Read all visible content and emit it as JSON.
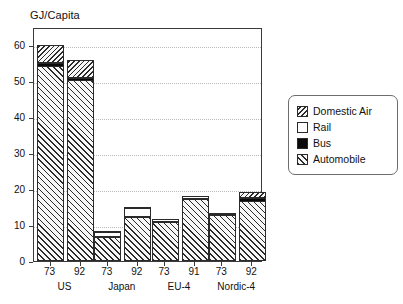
{
  "chart_data": {
    "type": "bar",
    "stacked": true,
    "title": "GJ/Capita",
    "xlabel": "",
    "ylabel": "",
    "ylim": [
      0,
      65
    ],
    "yticks": [
      0,
      10,
      20,
      30,
      40,
      50,
      60
    ],
    "ytick_labels": [
      "0",
      "10",
      "20",
      "30",
      "40",
      "50",
      "60"
    ],
    "grid": "horizontal-dotted",
    "legend_position": "right",
    "categories": [
      "73",
      "92",
      "73",
      "92",
      "73",
      "91",
      "73",
      "92"
    ],
    "groups": [
      {
        "label": "US",
        "years": [
          "73",
          "92"
        ]
      },
      {
        "label": "Japan",
        "years": [
          "73",
          "92"
        ]
      },
      {
        "label": "EU-4",
        "years": [
          "73",
          "91"
        ]
      },
      {
        "label": "Nordic-4",
        "years": [
          "73",
          "92"
        ]
      }
    ],
    "series": [
      {
        "name": "Automobile",
        "pattern": "forward-hatch",
        "values": [
          54.2,
          50.2,
          6.7,
          12.2,
          10.9,
          17.3,
          12.7,
          16.8
        ]
      },
      {
        "name": "Bus",
        "pattern": "solid-black",
        "values": [
          1.1,
          1.0,
          0.6,
          0.5,
          0.5,
          0.6,
          0.7,
          1.1
        ]
      },
      {
        "name": "Rail",
        "pattern": "white",
        "values": [
          0.3,
          0.3,
          1.3,
          2.5,
          0.7,
          0.8,
          0.6,
          0.4
        ]
      },
      {
        "name": "Domestic Air",
        "pattern": "backward-hatch",
        "values": [
          4.9,
          5.0,
          0.1,
          0.3,
          0.0,
          0.0,
          0.0,
          1.5
        ]
      }
    ],
    "totals": [
      60.5,
      56.5,
      8.7,
      15.5,
      12.1,
      18.7,
      14.0,
      19.8
    ]
  },
  "legend": {
    "items": [
      {
        "label": "Domestic Air",
        "pattern": "backward-hatch"
      },
      {
        "label": "Rail",
        "pattern": "white"
      },
      {
        "label": "Bus",
        "pattern": "solid-black"
      },
      {
        "label": "Automobile",
        "pattern": "forward-hatch"
      }
    ]
  },
  "colors": {
    "ink": "#2a2a2a",
    "grid": "#b9b9b9",
    "bus": "#0a0a0a",
    "rail": "#ffffff",
    "hatch_bg": "#f7f7f7"
  }
}
